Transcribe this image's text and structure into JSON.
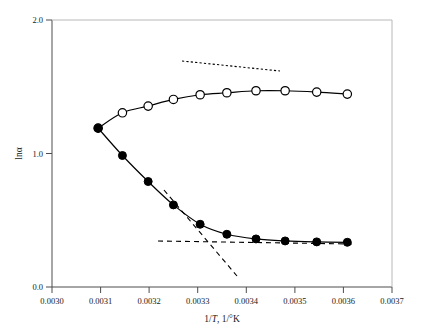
{
  "chart_data": {
    "type": "line",
    "title": "",
    "xlabel": "1/T, 1/°K",
    "ylabel": "lnα",
    "xlim": [
      0.003,
      0.0037
    ],
    "ylim": [
      0.0,
      2.0
    ],
    "grid": false,
    "legend": "none",
    "xticks": [
      0.003,
      0.0031,
      0.0032,
      0.0033,
      0.0034,
      0.0035,
      0.0036,
      0.0037
    ],
    "xtick_labels": [
      "0.0030",
      "0.0031",
      "0.0032",
      "0.0033",
      "0.0034",
      "0.0035",
      "0.0036",
      "0.0037"
    ],
    "yticks": [
      0.0,
      1.0,
      2.0
    ],
    "ytick_labels": [
      "0.0",
      "1.0",
      "2.0"
    ],
    "series": [
      {
        "name": "upper-branch-open-circles",
        "marker": "open-circle",
        "color": "#000000",
        "x": [
          0.003095,
          0.003145,
          0.003198,
          0.00325,
          0.003305,
          0.00336,
          0.00342,
          0.00348,
          0.003545,
          0.003608
        ],
        "y": [
          1.19,
          1.305,
          1.355,
          1.405,
          1.44,
          1.455,
          1.47,
          1.47,
          1.46,
          1.445
        ]
      },
      {
        "name": "lower-branch-filled-circles",
        "marker": "filled-circle",
        "color": "#000000",
        "x": [
          0.003095,
          0.003145,
          0.003198,
          0.00325,
          0.003305,
          0.00336,
          0.00342,
          0.00348,
          0.003545,
          0.003608
        ],
        "y": [
          1.19,
          0.985,
          0.79,
          0.615,
          0.47,
          0.395,
          0.36,
          0.345,
          0.338,
          0.335
        ]
      }
    ],
    "annotations": [
      {
        "name": "upper-asymptote-dotted",
        "style": "dotted",
        "x": [
          0.003268,
          0.00347
        ],
        "y": [
          1.565,
          1.49
        ]
      },
      {
        "name": "lower-horizontal-asymptote-dashed",
        "style": "dashed",
        "x": [
          0.00322,
          0.00362
        ],
        "y": [
          0.345,
          0.325
        ]
      },
      {
        "name": "lower-slope-asymptote-dashed",
        "style": "dashed",
        "x": [
          0.003232,
          0.00334
        ],
        "y": [
          0.72,
          0.085
        ]
      }
    ]
  },
  "axes": {
    "x_axis_label": "1/T, 1/°K",
    "x_axis_label_pre": "1/",
    "x_axis_label_italic": "T",
    "x_axis_label_post": ", 1/°K",
    "y_axis_label": "lnα"
  }
}
